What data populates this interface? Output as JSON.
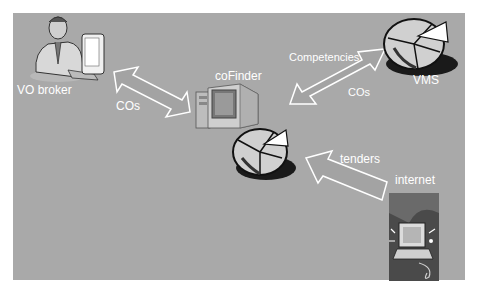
{
  "diagram": {
    "background": "#a9a9a9",
    "nodes": [
      {
        "id": "vo-broker",
        "label": "VO broker",
        "icon": "person-at-computer-icon"
      },
      {
        "id": "cofinder",
        "label": "coFinder",
        "icon": "desktop-computer-icon"
      },
      {
        "id": "vms",
        "label": "VMS",
        "icon": "pie-chart-icon"
      },
      {
        "id": "cofinder-db",
        "label": "",
        "icon": "pie-chart-icon"
      },
      {
        "id": "internet",
        "label": "internet",
        "icon": "internet-clipart-icon"
      }
    ],
    "edges": [
      {
        "from": "vo-broker",
        "to": "cofinder",
        "direction": "both",
        "label": "COs"
      },
      {
        "from": "cofinder",
        "to": "vms",
        "direction": "both",
        "labels": [
          "Competencies",
          "COs"
        ]
      },
      {
        "from": "internet",
        "to": "cofinder-db",
        "direction": "forward",
        "label": "tenders"
      }
    ]
  }
}
